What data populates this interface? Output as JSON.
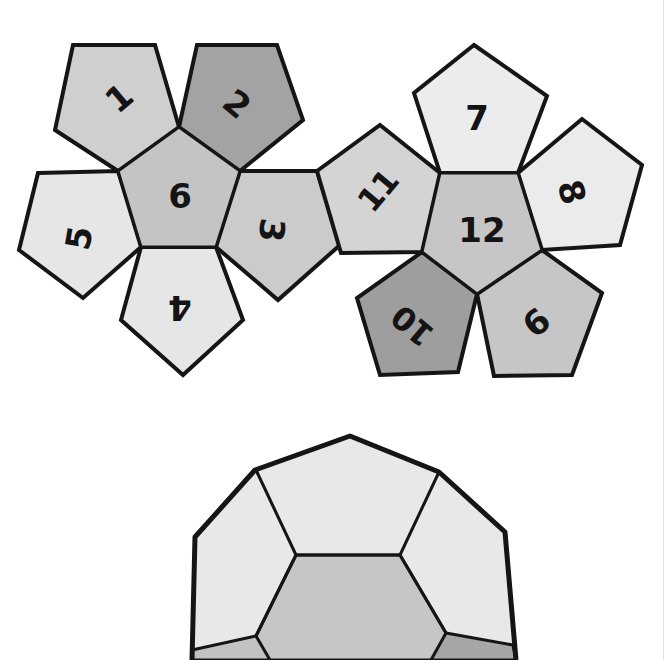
{
  "diagram": {
    "type": "dodecahedron-net",
    "colors": {
      "outline": "#151515",
      "light": "#e8e8e8",
      "lighter": "#ececec",
      "medium": "#cfcfcf",
      "mid": "#c4c4c4",
      "dark": "#9e9e9e",
      "background": "#ffffff"
    },
    "net": {
      "left_cluster": {
        "center_face": "6",
        "faces": [
          {
            "id": "f1",
            "label": "1",
            "shade": "medium",
            "rotation": 45
          },
          {
            "id": "f2",
            "label": "2",
            "shade": "dark",
            "rotation": 45
          },
          {
            "id": "f3",
            "label": "3",
            "shade": "mid",
            "rotation": 90
          },
          {
            "id": "f4",
            "label": "4",
            "shade": "light",
            "rotation": 180
          },
          {
            "id": "f5",
            "label": "5",
            "shade": "light",
            "rotation": -90
          },
          {
            "id": "f6",
            "label": "6",
            "shade": "mid",
            "rotation": 0
          }
        ]
      },
      "right_cluster": {
        "center_face": "12",
        "faces": [
          {
            "id": "f7",
            "label": "7",
            "shade": "lighter",
            "rotation": 0
          },
          {
            "id": "f8",
            "label": "8",
            "shade": "lighter",
            "rotation": 90
          },
          {
            "id": "f9",
            "label": "9",
            "shade": "mid",
            "rotation": 135
          },
          {
            "id": "f10",
            "label": "10",
            "shade": "dark",
            "rotation": -135
          },
          {
            "id": "f11",
            "label": "11",
            "shade": "medium",
            "rotation": -45
          },
          {
            "id": "f12",
            "label": "12",
            "shade": "mid",
            "rotation": 0
          }
        ]
      }
    },
    "solid_view": {
      "label": "assembled dodecahedron (partial view)",
      "visible_faces": [
        "top",
        "upper-left",
        "upper-right",
        "front",
        "lower-left",
        "lower-right"
      ]
    }
  }
}
